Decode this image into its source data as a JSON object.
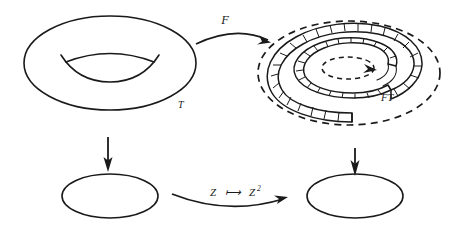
{
  "figure": {
    "background_color": "#ffffff",
    "ink_color": "#1a1a1a"
  },
  "labels": {
    "torus": "T",
    "spiral": "FT",
    "top_map": "F",
    "bottom_map_base": "Z",
    "bottom_map_arrow": "⟼",
    "bottom_map_target": "Z",
    "bottom_map_exponent": "2"
  },
  "nodes": [
    {
      "id": "torus",
      "name": "torus",
      "label": "T",
      "shape": "torus",
      "center": [
        110,
        63
      ],
      "outer_radii": [
        86,
        47
      ],
      "hole_radii": [
        42,
        14
      ],
      "line_style": "solid"
    },
    {
      "id": "spiral",
      "name": "spiral-bundle",
      "label": "FT",
      "shape": "hatched-spiral-in-dashed-ellipse",
      "center": [
        349,
        73
      ],
      "boundary_radii": [
        91,
        52
      ],
      "boundary_style": "dashed",
      "ribbon_turns": 2,
      "ribbon_hatched": true,
      "core": {
        "shape": "ellipse",
        "style": "dashed",
        "radii": [
          26,
          11
        ],
        "arrowhead": true
      }
    },
    {
      "id": "base_left",
      "name": "base-circle-left",
      "label": "",
      "shape": "ellipse",
      "center": [
        110,
        196
      ],
      "radii": [
        48,
        22
      ],
      "line_style": "solid"
    },
    {
      "id": "base_right",
      "name": "base-circle-right",
      "label": "",
      "shape": "ellipse",
      "center": [
        355,
        196
      ],
      "radii": [
        48,
        22
      ],
      "line_style": "solid"
    }
  ],
  "arrows": [
    {
      "id": "top_map",
      "name": "arrow-F",
      "label": "F",
      "from": "torus",
      "to": "spiral",
      "style": "curved",
      "label_position": "above"
    },
    {
      "id": "left_projection",
      "name": "arrow-projection-left",
      "label": "",
      "from": "torus",
      "to": "base_left",
      "style": "straight-vertical",
      "direction": "down"
    },
    {
      "id": "right_projection",
      "name": "arrow-projection-right",
      "label": "",
      "from": "spiral",
      "to": "base_right",
      "style": "straight-vertical",
      "direction": "down"
    },
    {
      "id": "bottom_map",
      "name": "arrow-z-squared",
      "label": "Z ⟼ Z²",
      "from": "base_left",
      "to": "base_right",
      "style": "curved",
      "label_position": "above"
    }
  ]
}
